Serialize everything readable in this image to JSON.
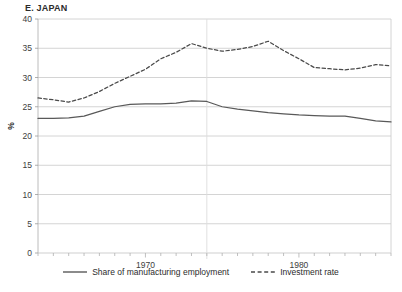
{
  "chart_data": {
    "type": "line",
    "title": "E. JAPAN",
    "xlabel": "",
    "ylabel": "%",
    "ylim": [
      0,
      40
    ],
    "ytick_labels": [
      "0",
      "5",
      "10",
      "15",
      "20",
      "25",
      "30",
      "35",
      "40"
    ],
    "yticks": [
      0,
      5,
      10,
      15,
      20,
      25,
      30,
      35,
      40
    ],
    "xlim": [
      1963,
      1986
    ],
    "xtick_labels": [
      "1970",
      "1980"
    ],
    "xticks": [
      1970,
      1980
    ],
    "grid": "horizontal",
    "legend_position": "bottom-center",
    "x": [
      1963,
      1964,
      1965,
      1966,
      1967,
      1968,
      1969,
      1970,
      1971,
      1972,
      1973,
      1974,
      1975,
      1976,
      1977,
      1978,
      1979,
      1980,
      1981,
      1982,
      1983,
      1984,
      1985,
      1986
    ],
    "series": [
      {
        "name": "Share of manufacturing employment",
        "style": "solid",
        "color": "#595959",
        "values": [
          23.0,
          23.0,
          23.1,
          23.4,
          24.2,
          25.0,
          25.4,
          25.5,
          25.5,
          25.6,
          26.0,
          25.9,
          25.0,
          24.6,
          24.3,
          24.0,
          23.8,
          23.6,
          23.5,
          23.4,
          23.4,
          23.0,
          22.6,
          22.4
        ]
      },
      {
        "name": "Investment rate",
        "style": "dashed",
        "color": "#4a4a4a",
        "values": [
          26.5,
          26.2,
          25.8,
          26.5,
          27.6,
          29.0,
          30.2,
          31.4,
          33.2,
          34.3,
          35.8,
          35.0,
          34.5,
          34.8,
          35.3,
          36.2,
          34.6,
          33.2,
          31.7,
          31.5,
          31.3,
          31.6,
          32.2,
          32.0
        ]
      }
    ],
    "investment_rate_tail": [
      31.3,
      30.5,
      29.8,
      29.0,
      28.2
    ]
  },
  "legend": {
    "items": [
      {
        "label": "Share of manufacturing employment",
        "icon": "solid-line-icon"
      },
      {
        "label": "Investment rate",
        "icon": "dashed-line-icon"
      }
    ]
  }
}
